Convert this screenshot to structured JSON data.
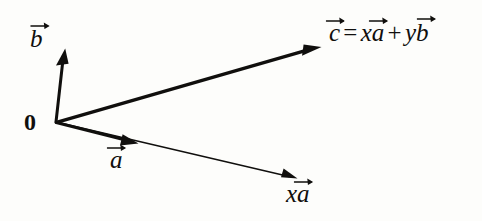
{
  "figure": {
    "kind": "vector-addition-diagram",
    "background_color": "#fdfdfb",
    "ink_color": "#100f0d",
    "width": 482,
    "height": 221,
    "origin_label": "0",
    "labels": {
      "b": {
        "letter": "b",
        "text": "b"
      },
      "a": {
        "letter": "a",
        "text": "a"
      },
      "xa": {
        "coefficient": "x",
        "letter": "a",
        "text": "xa"
      },
      "equation": {
        "lhs_letter": "c",
        "equals": "=",
        "term1_coefficient": "x",
        "term1_letter": "a",
        "plus": "+",
        "term2_coefficient": "y",
        "term2_letter": "b",
        "text": "c = xa + yb"
      }
    },
    "vectors": [
      {
        "name": "b",
        "style": "thick",
        "from": [
          56,
          122
        ],
        "to": [
          65,
          50
        ],
        "stroke_width": 3.0,
        "arrowhead": "solid-filled"
      },
      {
        "name": "c",
        "style": "thick",
        "from": [
          56,
          122
        ],
        "to": [
          320,
          48
        ],
        "stroke_width": 3.2,
        "arrowhead": "solid-filled"
      },
      {
        "name": "xa",
        "style": "thin",
        "from": [
          56,
          122
        ],
        "to": [
          296,
          178
        ],
        "stroke_width": 1.4,
        "arrowhead": "solid-filled"
      },
      {
        "name": "a",
        "style": "thick-overlay",
        "from": [
          56,
          122
        ],
        "to": [
          137,
          143
        ],
        "stroke_width": 3.0,
        "arrowhead": "solid-filled"
      }
    ]
  }
}
